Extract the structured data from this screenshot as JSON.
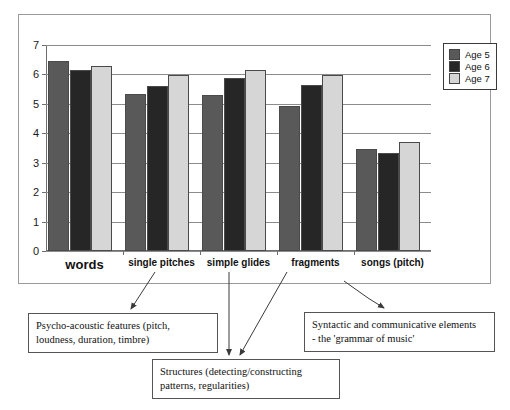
{
  "chart_data": {
    "type": "bar",
    "title": "",
    "xlabel": "",
    "ylabel": "",
    "ylim": [
      0,
      7
    ],
    "yticks": [
      0,
      1,
      2,
      3,
      4,
      5,
      6,
      7
    ],
    "grid": true,
    "legend_position": "top-right",
    "categories": [
      "words",
      "single pitches",
      "simple glides",
      "fragments",
      "songs (pitch)"
    ],
    "series": [
      {
        "name": "Age 5",
        "color": "#595959",
        "values": [
          6.45,
          5.35,
          5.3,
          4.93,
          3.47
        ]
      },
      {
        "name": "Age 6",
        "color": "#262626",
        "values": [
          6.15,
          5.62,
          5.87,
          5.65,
          3.33
        ]
      },
      {
        "name": "Age 7",
        "color": "#d6d6d6",
        "values": [
          6.3,
          5.97,
          6.15,
          5.97,
          3.72
        ]
      }
    ]
  },
  "legend": {
    "items": [
      {
        "label": "Age 5",
        "color": "#595959"
      },
      {
        "label": "Age 6",
        "color": "#262626"
      },
      {
        "label": "Age 7",
        "color": "#d6d6d6"
      }
    ]
  },
  "axis": {
    "y_tick_labels": [
      "7",
      "6",
      "5",
      "4",
      "3",
      "2",
      "1",
      "0"
    ]
  },
  "categories": [
    {
      "label": "words",
      "emphasis": "primary"
    },
    {
      "label": "single pitches",
      "emphasis": "normal"
    },
    {
      "label": "simple glides",
      "emphasis": "normal"
    },
    {
      "label": "fragments",
      "emphasis": "normal"
    },
    {
      "label": "songs (pitch)",
      "emphasis": "normal"
    }
  ],
  "callouts": {
    "psychoacoustic": {
      "line1": "Psycho-acoustic features (pitch,",
      "line2": "loudness, duration, timbre)"
    },
    "structures": {
      "line1": "Structures (detecting/constructing",
      "line2": "patterns, regularities)"
    },
    "syntactic": {
      "line1": "Syntactic and communicative elements",
      "line2": "- the 'grammar of music'"
    }
  }
}
